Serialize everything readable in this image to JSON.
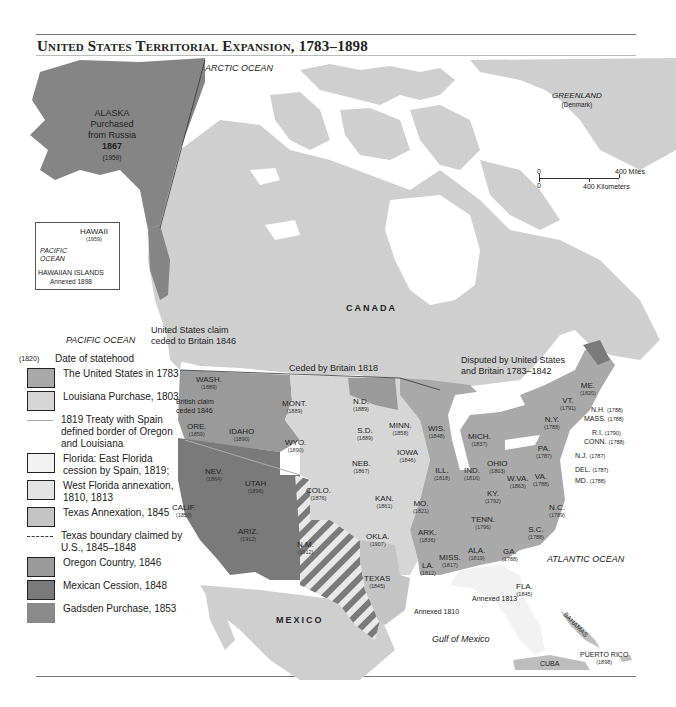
{
  "title": "United States Territorial Expansion, 1783–1898",
  "oceans": {
    "arctic": "ARCTIC OCEAN",
    "pacific": "PACIFIC OCEAN",
    "atlantic": "ATLANTIC OCEAN",
    "gulf": "Gulf of Mexico"
  },
  "countries": {
    "canada": "CANADA",
    "mexico": "MEXICO",
    "greenland": "GREENLAND",
    "greenland_note": "(Denmark)",
    "cuba": "CUBA",
    "bahamas": "BAHAMAS",
    "puerto_rico": "PUERTO RICO",
    "puerto_rico_year": "(1898)"
  },
  "alaska": {
    "name": "ALASKA",
    "line1": "Purchased",
    "line2": "from Russia",
    "year": "1867",
    "statehood": "(1959)"
  },
  "hawaii_inset": {
    "name": "HAWAII",
    "statehood": "(1959)",
    "ocean1": "PACIFIC",
    "ocean2": "OCEAN",
    "islands": "HAWAIIAN ISLANDS",
    "annexed": "Annexed 1898"
  },
  "scale": {
    "zero_top": "0",
    "zero_bottom": "0",
    "miles": "400 Miles",
    "km": "400 Kilometers"
  },
  "annotations": {
    "us_claim_line1": "United States claim",
    "us_claim_line2": "ceded to Britain 1846",
    "ceded_1818": "Ceded by Britain 1818",
    "disputed_line1": "Disputed by United States",
    "disputed_line2": "and Britain 1783–1842",
    "british_claim_line1": "British claim",
    "british_claim_line2": "ceded 1846",
    "annexed_1810": "Annexed 1810",
    "annexed_1813": "Annexed 1813"
  },
  "states": [
    {
      "abbr": "WASH.",
      "year": "(1889)"
    },
    {
      "abbr": "ORE.",
      "year": "(1859)"
    },
    {
      "abbr": "CALIF.",
      "year": "(1850)"
    },
    {
      "abbr": "IDAHO",
      "year": "(1890)"
    },
    {
      "abbr": "NEV.",
      "year": "(1864)"
    },
    {
      "abbr": "UTAH",
      "year": "(1896)"
    },
    {
      "abbr": "ARIZ.",
      "year": "(1912)"
    },
    {
      "abbr": "MONT.",
      "year": "(1889)"
    },
    {
      "abbr": "WYO.",
      "year": "(1890)"
    },
    {
      "abbr": "COLO.",
      "year": "(1876)"
    },
    {
      "abbr": "N.M.",
      "year": "(1912)"
    },
    {
      "abbr": "N.D.",
      "year": "(1889)"
    },
    {
      "abbr": "S.D.",
      "year": "(1889)"
    },
    {
      "abbr": "NEB.",
      "year": "(1867)"
    },
    {
      "abbr": "KAN.",
      "year": "(1861)"
    },
    {
      "abbr": "OKLA.",
      "year": "(1907)"
    },
    {
      "abbr": "TEXAS",
      "year": "(1845)"
    },
    {
      "abbr": "MINN.",
      "year": "(1858)"
    },
    {
      "abbr": "IOWA",
      "year": "(1846)"
    },
    {
      "abbr": "MO.",
      "year": "(1821)"
    },
    {
      "abbr": "ARK.",
      "year": "(1836)"
    },
    {
      "abbr": "LA.",
      "year": "(1812)"
    },
    {
      "abbr": "WIS.",
      "year": "(1848)"
    },
    {
      "abbr": "ILL.",
      "year": "(1818)"
    },
    {
      "abbr": "MICH.",
      "year": "(1837)"
    },
    {
      "abbr": "IND.",
      "year": "(1816)"
    },
    {
      "abbr": "OHIO",
      "year": "(1803)"
    },
    {
      "abbr": "KY.",
      "year": "(1792)"
    },
    {
      "abbr": "TENN.",
      "year": "(1796)"
    },
    {
      "abbr": "MISS.",
      "year": "(1817)"
    },
    {
      "abbr": "ALA.",
      "year": "(1819)"
    },
    {
      "abbr": "GA.",
      "year": "(1788)"
    },
    {
      "abbr": "FLA.",
      "year": "(1845)"
    },
    {
      "abbr": "S.C.",
      "year": "(1788)"
    },
    {
      "abbr": "N.C.",
      "year": "(1789)"
    },
    {
      "abbr": "VA.",
      "year": "(1788)"
    },
    {
      "abbr": "W.VA.",
      "year": "(1863)"
    },
    {
      "abbr": "PA.",
      "year": "(1787)"
    },
    {
      "abbr": "N.Y.",
      "year": "(1788)"
    },
    {
      "abbr": "VT.",
      "year": "(1791)"
    },
    {
      "abbr": "ME.",
      "year": "(1820)"
    },
    {
      "abbr": "N.H.",
      "year": "(1788)"
    },
    {
      "abbr": "MASS.",
      "year": "(1788)"
    },
    {
      "abbr": "R.I.",
      "year": "(1790)"
    },
    {
      "abbr": "CONN.",
      "year": "(1788)"
    },
    {
      "abbr": "N.J.",
      "year": "(1787)"
    },
    {
      "abbr": "DEL.",
      "year": "(1787)"
    },
    {
      "abbr": "MD.",
      "year": "(1788)"
    }
  ],
  "legend": {
    "key_sample": "(1820)",
    "key_label": "Date of statehood",
    "items": [
      {
        "label": "The United States in 1783",
        "color": "#a9a9a9",
        "type": "swatch"
      },
      {
        "label": "Louisiana Purchase, 1803",
        "color": "#d6d6d6",
        "type": "swatch"
      },
      {
        "label": "1819 Treaty with Spain defined border of Oregon and Louisiana",
        "color": "#aaaaaa",
        "type": "line"
      },
      {
        "label": "Florida: East Florida cession by Spain, 1819;",
        "color": "#f2f2f2",
        "type": "swatch"
      },
      {
        "label": "West Florida annexation, 1810, 1813",
        "color": "#e4e4e4",
        "type": "swatch"
      },
      {
        "label": "Texas Annexation, 1845",
        "color": "#c4c4c4",
        "type": "swatch"
      },
      {
        "label": "Texas boundary claimed by U.S., 1845–1848",
        "color": "#333333",
        "type": "dash"
      },
      {
        "label": "Oregon Country, 1846",
        "color": "#9a9a9a",
        "type": "swatch"
      },
      {
        "label": "Mexican Cession, 1848",
        "color": "#7a7a7a",
        "type": "swatch"
      },
      {
        "label": "Gadsden Purchase, 1853",
        "color": "#8a8a8a",
        "type": "swatch"
      }
    ]
  },
  "colors": {
    "water": "#ffffff",
    "foreign_land": "#cfcfcf",
    "us_1783": "#a9a9a9",
    "louisiana": "#d6d6d6",
    "florida": "#f2f2f2",
    "texas": "#c4c4c4",
    "oregon": "#9a9a9a",
    "mexican_cession": "#7a7a7a",
    "alaska": "#858585",
    "rule": "#777777"
  }
}
